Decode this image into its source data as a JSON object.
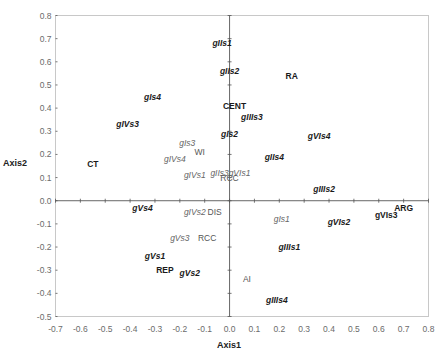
{
  "chart_data": {
    "type": "scatter",
    "title": "",
    "xlabel": "Axis1",
    "ylabel": "Axis2",
    "xlim": [
      -0.7,
      0.8
    ],
    "ylim": [
      -0.5,
      0.8
    ],
    "grid": false,
    "legend": null,
    "x_ticks": [
      "-0.7",
      "-0.6",
      "-0.5",
      "-0.4",
      "-0.3",
      "-0.2",
      "-0.1",
      "0.0",
      "0.1",
      "0.2",
      "0.3",
      "0.4",
      "0.5",
      "0.6",
      "0.7",
      "0.8"
    ],
    "y_ticks": [
      "0.8",
      "0.7",
      "0.6",
      "0.5",
      "0.4",
      "0.3",
      "0.2",
      "0.1",
      "0.0",
      "-0.1",
      "-0.2",
      "-0.3",
      "-0.4",
      "-0.5"
    ],
    "points": [
      {
        "label": "gIIs1",
        "x": -0.03,
        "y": 0.68,
        "style": "bolditalic"
      },
      {
        "label": "gIIs2",
        "x": 0.0,
        "y": 0.56,
        "style": "bolditalic"
      },
      {
        "label": "RA",
        "x": 0.25,
        "y": 0.54,
        "style": "bold"
      },
      {
        "label": "gIs4",
        "x": -0.31,
        "y": 0.45,
        "style": "bolditalic"
      },
      {
        "label": "CENT",
        "x": 0.02,
        "y": 0.41,
        "style": "bold"
      },
      {
        "label": "gIIIs3",
        "x": 0.09,
        "y": 0.36,
        "style": "bolditalic"
      },
      {
        "label": "gIVs3",
        "x": -0.41,
        "y": 0.33,
        "style": "bolditalic"
      },
      {
        "label": "gIs2",
        "x": 0.0,
        "y": 0.29,
        "style": "bolditalic"
      },
      {
        "label": "gVIs4",
        "x": 0.36,
        "y": 0.28,
        "style": "bolditalic"
      },
      {
        "label": "gIs3",
        "x": -0.17,
        "y": 0.25,
        "style": "grayitalic"
      },
      {
        "label": "WI",
        "x": -0.12,
        "y": 0.21,
        "style": "gray"
      },
      {
        "label": "gIIs4",
        "x": 0.18,
        "y": 0.19,
        "style": "bolditalic"
      },
      {
        "label": "CT",
        "x": -0.55,
        "y": 0.16,
        "style": "bold"
      },
      {
        "label": "gIVs4",
        "x": -0.22,
        "y": 0.18,
        "style": "grayitalic"
      },
      {
        "label": "gIVs1",
        "x": -0.14,
        "y": 0.11,
        "style": "grayitalic"
      },
      {
        "label": "gIIs3",
        "x": -0.04,
        "y": 0.12,
        "style": "grayitalic"
      },
      {
        "label": "gVIs1",
        "x": 0.04,
        "y": 0.12,
        "style": "grayitalic"
      },
      {
        "label": "RCC",
        "x": 0.0,
        "y": 0.1,
        "style": "gray"
      },
      {
        "label": "gIIIs2",
        "x": 0.38,
        "y": 0.05,
        "style": "bolditalic"
      },
      {
        "label": "gVs4",
        "x": -0.35,
        "y": -0.03,
        "style": "bolditalic"
      },
      {
        "label": "ARG",
        "x": 0.7,
        "y": -0.03,
        "style": "bold"
      },
      {
        "label": "gIVs2",
        "x": -0.14,
        "y": -0.05,
        "style": "grayitalic"
      },
      {
        "label": "DIS",
        "x": -0.06,
        "y": -0.05,
        "style": "gray"
      },
      {
        "label": "gIs1",
        "x": 0.21,
        "y": -0.08,
        "style": "grayitalic"
      },
      {
        "label": "gVIs3",
        "x": 0.63,
        "y": -0.06,
        "style": "bold"
      },
      {
        "label": "gVIs2",
        "x": 0.44,
        "y": -0.09,
        "style": "bolditalic"
      },
      {
        "label": "gVs3",
        "x": -0.2,
        "y": -0.16,
        "style": "grayitalic"
      },
      {
        "label": "RCC",
        "x": -0.09,
        "y": -0.16,
        "style": "gray"
      },
      {
        "label": "gIIIs1",
        "x": 0.24,
        "y": -0.2,
        "style": "bolditalic"
      },
      {
        "label": "gVs1",
        "x": -0.3,
        "y": -0.24,
        "style": "bolditalic"
      },
      {
        "label": "REP",
        "x": -0.26,
        "y": -0.3,
        "style": "bold"
      },
      {
        "label": "gVs2",
        "x": -0.16,
        "y": -0.31,
        "style": "bolditalic"
      },
      {
        "label": "AI",
        "x": 0.07,
        "y": -0.34,
        "style": "gray"
      },
      {
        "label": "gIIIs4",
        "x": 0.19,
        "y": -0.43,
        "style": "bolditalic"
      }
    ]
  },
  "labels": {
    "xlabel": "Axis1",
    "ylabel": "Axis2"
  }
}
